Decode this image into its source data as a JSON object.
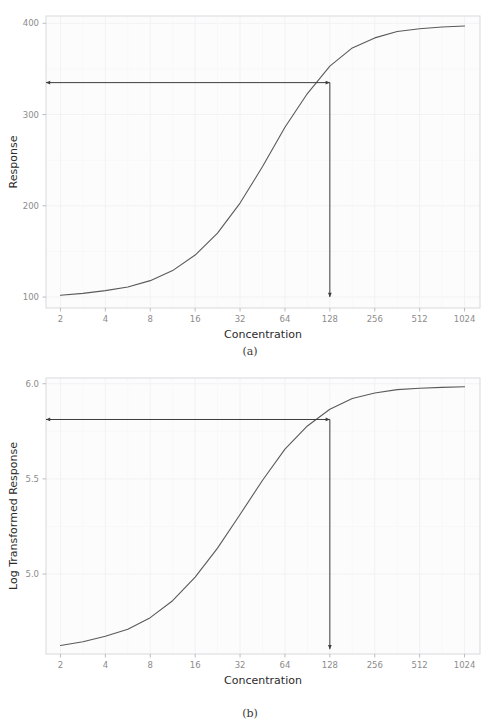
{
  "figure": {
    "clipped_header_text": "· · ·· ·",
    "background_color": "#ffffff",
    "panel_background_color": "#fcfcfc",
    "grid_color": "#f2f2f4",
    "axis_text_color": "#8c8c8c",
    "axis_title_color": "#2b2b2b",
    "curve_color": "#5a5a5a",
    "annotation_color": "#3d3d3d",
    "border_color": "#d9d9dd"
  },
  "captions": {
    "a": "(a)",
    "b": "(b)"
  },
  "chart_data": [
    {
      "type": "line",
      "panel": "a",
      "title": "",
      "xlabel": "Concentration",
      "ylabel": "Response",
      "xscale": "log2",
      "xlim": [
        1.6,
        1300
      ],
      "ylim": [
        88,
        408
      ],
      "xticks": [
        2,
        4,
        8,
        16,
        32,
        64,
        128,
        256,
        512,
        1024
      ],
      "xticklabels": [
        "2",
        "4",
        "8",
        "16",
        "32",
        "64",
        "128",
        "256",
        "512",
        "1024"
      ],
      "yticks": [
        100,
        200,
        300,
        400
      ],
      "yticklabels": [
        "100",
        "200",
        "300",
        "400"
      ],
      "grid": true,
      "legend": "none",
      "series": [
        {
          "name": "Dose response",
          "x": [
            2,
            2.83,
            4,
            5.66,
            8,
            11.3,
            16,
            22.6,
            32,
            45.3,
            64,
            90.5,
            128,
            181,
            256,
            362,
            512,
            724,
            1024
          ],
          "values": [
            102,
            104,
            107,
            111,
            118,
            129,
            146,
            170,
            203,
            243,
            286,
            323,
            353,
            373,
            384,
            391,
            394,
            396,
            397
          ]
        }
      ],
      "annotations": [
        {
          "name": "horizontal-readout-arrow",
          "kind": "double-arrow",
          "from": [
            1.6,
            335
          ],
          "to": [
            128,
            335
          ]
        },
        {
          "name": "vertical-readout-arrow",
          "kind": "arrow",
          "from": [
            128,
            335
          ],
          "to": [
            128,
            100
          ]
        }
      ],
      "readout": {
        "concentration": 128,
        "response": 335
      }
    },
    {
      "type": "line",
      "panel": "b",
      "title": "",
      "xlabel": "Concentration",
      "ylabel": "Log Transformed Response",
      "xscale": "log2",
      "xlim": [
        1.6,
        1300
      ],
      "ylim": [
        4.58,
        6.03
      ],
      "xticks": [
        2,
        4,
        8,
        16,
        32,
        64,
        128,
        256,
        512,
        1024
      ],
      "xticklabels": [
        "2",
        "4",
        "8",
        "16",
        "32",
        "64",
        "128",
        "256",
        "512",
        "1024"
      ],
      "yticks": [
        5.0,
        5.5,
        6.0
      ],
      "yticklabels": [
        "5.0",
        "5.5",
        "6.0"
      ],
      "grid": true,
      "legend": "none",
      "series": [
        {
          "name": "Log dose response",
          "x": [
            2,
            2.83,
            4,
            5.66,
            8,
            11.3,
            16,
            22.6,
            32,
            45.3,
            64,
            90.5,
            128,
            181,
            256,
            362,
            512,
            724,
            1024
          ],
          "values": [
            4.625,
            4.644,
            4.673,
            4.71,
            4.771,
            4.86,
            4.984,
            5.136,
            5.313,
            5.493,
            5.656,
            5.778,
            5.866,
            5.922,
            5.951,
            5.969,
            5.976,
            5.981,
            5.984
          ]
        }
      ],
      "annotations": [
        {
          "name": "horizontal-readout-arrow",
          "kind": "double-arrow",
          "from": [
            1.6,
            5.812
          ],
          "to": [
            128,
            5.812
          ]
        },
        {
          "name": "vertical-readout-arrow",
          "kind": "arrow",
          "from": [
            128,
            5.812
          ],
          "to": [
            128,
            4.605
          ]
        }
      ],
      "readout": {
        "concentration": 128,
        "log_response": 5.81
      }
    }
  ]
}
